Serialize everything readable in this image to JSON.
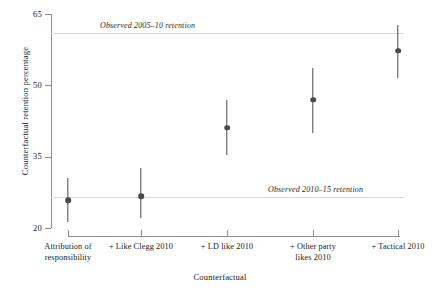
{
  "chart_data": {
    "type": "scatter",
    "title": "",
    "xlabel": "Counterfactual",
    "ylabel": "Counterfactual retention percentage",
    "ylim": [
      20,
      65
    ],
    "yticks": [
      20,
      35,
      50,
      65
    ],
    "grid": false,
    "legend": "none",
    "categories": [
      "Attribution of responsibility",
      "+ Like Clegg 2010",
      "+ LD like 2010",
      "+ Other party likes 2010",
      "+ Tactical 2010"
    ],
    "series": [
      {
        "name": "Counterfactual retention estimate",
        "values": [
          25.9,
          26.7,
          41.1,
          47.0,
          57.3
        ],
        "ci_low": [
          21.3,
          22.1,
          35.4,
          40.0,
          51.6
        ],
        "ci_high": [
          30.5,
          32.6,
          47.0,
          53.7,
          62.6
        ]
      }
    ],
    "reference_lines": [
      {
        "label": "Observed 2005–10 retention",
        "value": 61.1
      },
      {
        "label": "Observed 2010–15 retention",
        "value": 26.5
      }
    ]
  },
  "axes": {
    "y_ticks": [
      {
        "label": "65",
        "value": 65
      },
      {
        "label": "50",
        "value": 50
      },
      {
        "label": "35",
        "value": 35
      },
      {
        "label": "20",
        "value": 20
      }
    ],
    "y_title": "Counterfactual retention percentage",
    "x_title": "Counterfactual",
    "x_ticks": [
      {
        "label_line1": "Attribution of",
        "label_line2": "responsibility"
      },
      {
        "label_line1": "+ Like Clegg 2010",
        "label_line2": ""
      },
      {
        "label_line1": "+ LD like 2010",
        "label_line2": ""
      },
      {
        "label_line1": "+ Other party",
        "label_line2": "likes 2010"
      },
      {
        "label_line1": "+ Tactical 2010",
        "label_line2": ""
      }
    ]
  },
  "annotations": {
    "upper_ref_label": "Observed 2005–10 retention",
    "lower_ref_label": "Observed 2010–15 retention"
  },
  "colors": {
    "marker": "#4a4a4a",
    "axis": "#8d8d8d",
    "reference_line": "#d9d9d9",
    "text": "#1a1a1a",
    "background": "#ffffff"
  }
}
